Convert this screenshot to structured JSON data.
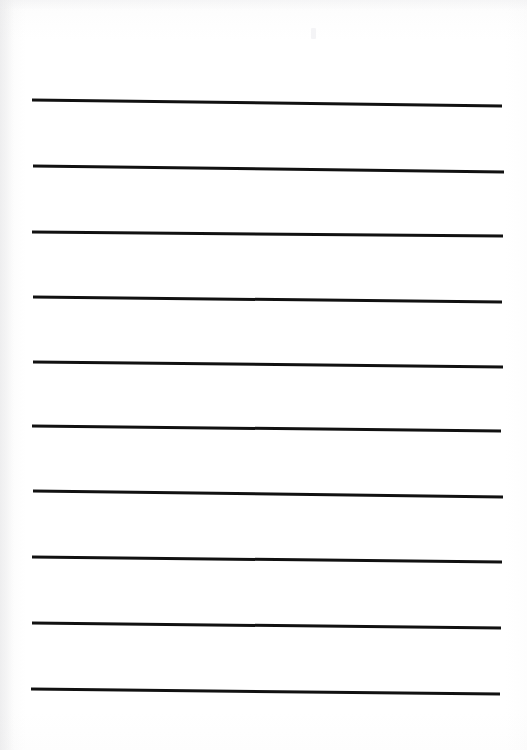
{
  "document": {
    "kind": "ruled-note-paper-scan",
    "title": "Blank lined paper",
    "page_width": 527,
    "page_height": 750,
    "background_color": "#ffffff",
    "paper_tone_color": "#fdfdfd",
    "rule_color": "#111111",
    "rule_thickness": 3,
    "rule_count": 10,
    "text_content": "",
    "notes_written": "none",
    "margin_left": 32,
    "margin_right": 25,
    "rule_spacing": 65.5
  },
  "rules": [
    {
      "index": 1,
      "x1": 32,
      "y1": 100,
      "x2": 502,
      "y2": 106
    },
    {
      "index": 2,
      "x1": 33,
      "y1": 166,
      "x2": 504,
      "y2": 172
    },
    {
      "index": 3,
      "x1": 32,
      "y1": 232,
      "x2": 503,
      "y2": 236
    },
    {
      "index": 4,
      "x1": 33,
      "y1": 297,
      "x2": 502,
      "y2": 302
    },
    {
      "index": 5,
      "x1": 33,
      "y1": 362,
      "x2": 503,
      "y2": 367
    },
    {
      "index": 6,
      "x1": 32,
      "y1": 426,
      "x2": 501,
      "y2": 431
    },
    {
      "index": 7,
      "x1": 33,
      "y1": 491,
      "x2": 503,
      "y2": 497
    },
    {
      "index": 8,
      "x1": 32,
      "y1": 557,
      "x2": 502,
      "y2": 562
    },
    {
      "index": 9,
      "x1": 32,
      "y1": 623,
      "x2": 501,
      "y2": 628
    },
    {
      "index": 10,
      "x1": 31,
      "y1": 689,
      "x2": 500,
      "y2": 694
    }
  ]
}
